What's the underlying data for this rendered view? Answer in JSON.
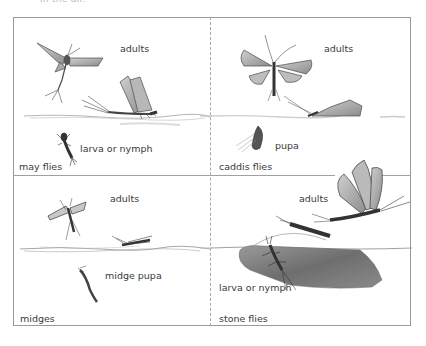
{
  "caption_fragment": "in the air.",
  "panels": [
    {
      "id": "may-flies",
      "title": "may flies",
      "labels": {
        "adults": "adults",
        "larva": "larva or nymph"
      }
    },
    {
      "id": "caddis-flies",
      "title": "caddis flies",
      "labels": {
        "adults": "adults",
        "pupa": "pupa"
      }
    },
    {
      "id": "midges",
      "title": "midges",
      "labels": {
        "adults": "adults",
        "pupa": "midge pupa"
      }
    },
    {
      "id": "stone-flies",
      "title": "stone flies",
      "labels": {
        "adults": "adults",
        "larva": "larva or nymph"
      }
    }
  ],
  "colors": {
    "frame": "#9a9a9a",
    "text": "#3a3a3a",
    "insect": "#4a4a4a",
    "rock": "#7a7a7a",
    "water": "#b0b0b0"
  }
}
